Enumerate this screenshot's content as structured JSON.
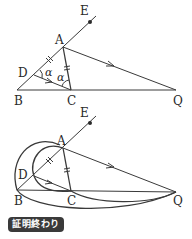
{
  "figure1": {
    "points": {
      "A": "A",
      "B": "B",
      "C": "C",
      "D": "D",
      "E": "E",
      "Q": "Q"
    },
    "angle_label_1": "α",
    "angle_label_2": "α"
  },
  "figure2": {
    "points": {
      "A": "A",
      "B": "B",
      "C": "C",
      "D": "D",
      "E": "E",
      "Q": "Q"
    }
  },
  "badge": {
    "text": "証明終わり"
  },
  "colors": {
    "line": "#3a3a3a",
    "badge_bg": "#3a3a3a"
  }
}
